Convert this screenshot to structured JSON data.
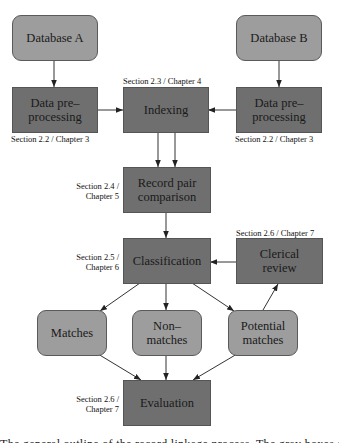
{
  "diagram": {
    "type": "flowchart",
    "colors": {
      "data_node": "#9d9d9d",
      "process_node": "#6f6f6f",
      "edge": "#333333",
      "text": "#1a1a1a"
    },
    "nodes": {
      "database_a": {
        "label": "Database A",
        "kind": "data"
      },
      "database_b": {
        "label": "Database B",
        "kind": "data"
      },
      "preprocess_a": {
        "label": "Data pre–\nprocessing",
        "kind": "process"
      },
      "indexing": {
        "label": "Indexing",
        "kind": "process"
      },
      "preprocess_b": {
        "label": "Data pre–\nprocessing",
        "kind": "process"
      },
      "comparison": {
        "label": "Record pair\ncomparison",
        "kind": "process"
      },
      "classification": {
        "label": "Classification",
        "kind": "process"
      },
      "clerical_review": {
        "label": "Clerical\nreview",
        "kind": "process"
      },
      "matches": {
        "label": "Matches",
        "kind": "data"
      },
      "non_matches": {
        "label": "Non–\nmatches",
        "kind": "data"
      },
      "potential_matches": {
        "label": "Potential\nmatches",
        "kind": "data"
      },
      "evaluation": {
        "label": "Evaluation",
        "kind": "process"
      }
    },
    "annotations": {
      "preprocess_a": "Section 2.2 / Chapter 3",
      "indexing": "Section 2.3 / Chapter 4",
      "preprocess_b": "Section 2.2 / Chapter 3",
      "comparison": "Section 2.4 /\nChapter 5",
      "classification": "Section 2.5 /\nChapter 6",
      "clerical_review": "Section 2.6 / Chapter 7",
      "evaluation": "Section 2.6 /\nChapter 7"
    },
    "edges": [
      {
        "from": "database_a",
        "to": "preprocess_a"
      },
      {
        "from": "database_b",
        "to": "preprocess_b"
      },
      {
        "from": "preprocess_a",
        "to": "indexing"
      },
      {
        "from": "preprocess_b",
        "to": "indexing"
      },
      {
        "from": "indexing",
        "to": "comparison",
        "count": 2
      },
      {
        "from": "comparison",
        "to": "classification"
      },
      {
        "from": "clerical_review",
        "to": "classification"
      },
      {
        "from": "classification",
        "to": "matches"
      },
      {
        "from": "classification",
        "to": "non_matches"
      },
      {
        "from": "classification",
        "to": "potential_matches"
      },
      {
        "from": "potential_matches",
        "to": "clerical_review"
      },
      {
        "from": "matches",
        "to": "evaluation"
      },
      {
        "from": "non_matches",
        "to": "evaluation"
      },
      {
        "from": "potential_matches",
        "to": "evaluation"
      }
    ]
  },
  "caption": {
    "text": "The general outline of the record linkage process. The gray boxes show the steps"
  }
}
